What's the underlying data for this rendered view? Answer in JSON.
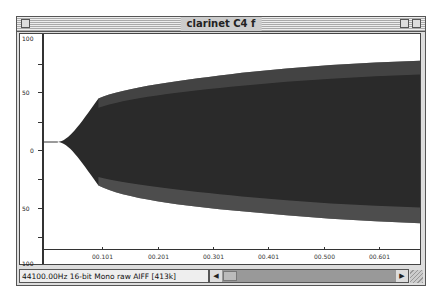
{
  "window": {
    "title": "clarinet C4 f"
  },
  "ruler": {
    "labels": [
      "100",
      "50",
      "0",
      "50",
      "100"
    ]
  },
  "timeline": {
    "labels": [
      "00.101",
      "00.201",
      "00.301",
      "00.401",
      "00.500",
      "00.601"
    ]
  },
  "status": {
    "text": "44100.00Hz  16-bit Mono raw AIFF [413k]"
  },
  "scrollbar": {
    "left_arrow": "◀",
    "right_arrow": "▶"
  },
  "colors": {
    "waveform": "#2a2a2a",
    "background": "#ffffff"
  }
}
